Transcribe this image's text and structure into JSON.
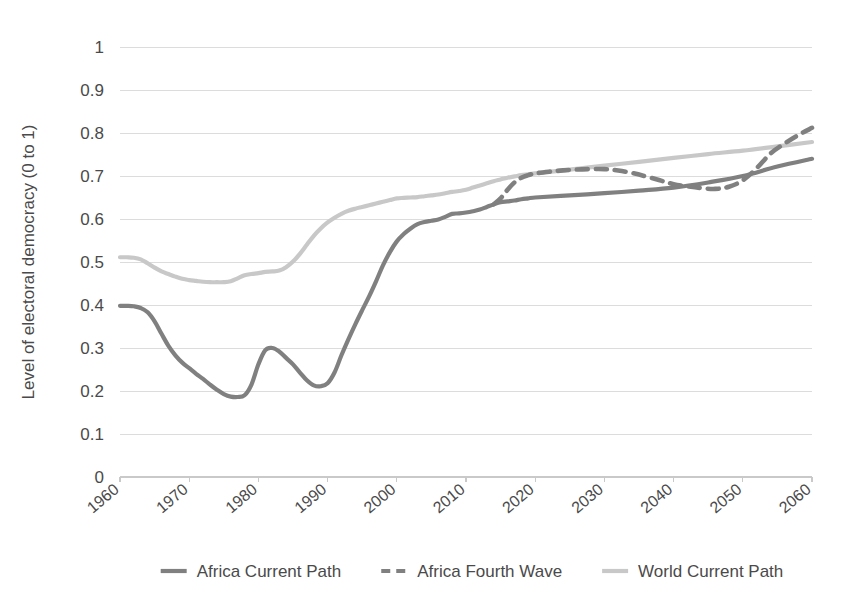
{
  "chart_data": {
    "type": "line",
    "title": "",
    "xlabel": "",
    "ylabel": "Level of electoral democracy (0 to 1)",
    "xlim": [
      1960,
      2060
    ],
    "ylim": [
      0,
      1
    ],
    "grid": true,
    "legend_position": "bottom",
    "ytick_labels": [
      "1",
      "0.9",
      "0.8",
      "0.7",
      "0.6",
      "0.5",
      "0.4",
      "0.3",
      "0.2",
      "0.1",
      "0"
    ],
    "ytick_values": [
      1,
      0.9,
      0.8,
      0.7,
      0.6,
      0.5,
      0.4,
      0.3,
      0.2,
      0.1,
      0
    ],
    "xtick_labels": [
      "1960",
      "1970",
      "1980",
      "1990",
      "2000",
      "2010",
      "2020",
      "2030",
      "2040",
      "2050",
      "2060"
    ],
    "xtick_values": [
      1960,
      1970,
      1980,
      1990,
      2000,
      2010,
      2020,
      2030,
      2040,
      2050,
      2060
    ],
    "colors": {
      "africa_current_path": "#808080",
      "africa_fourth_wave": "#808080",
      "world_current_path": "#c8c8c8",
      "gridline": "#dcdcdc",
      "axis": "#c9c9c9",
      "text": "#4a4a4a",
      "background": "#ffffff"
    },
    "series": [
      {
        "name": "Africa Current Path",
        "style": "solid",
        "color": "#808080",
        "x": [
          1960,
          1961,
          1962,
          1963,
          1964,
          1965,
          1966,
          1967,
          1968,
          1969,
          1970,
          1971,
          1972,
          1973,
          1974,
          1975,
          1976,
          1977,
          1978,
          1979,
          1980,
          1981,
          1982,
          1983,
          1984,
          1985,
          1986,
          1987,
          1988,
          1989,
          1990,
          1991,
          1992,
          1993,
          1994,
          1995,
          1996,
          1997,
          1998,
          1999,
          2000,
          2001,
          2002,
          2003,
          2004,
          2005,
          2006,
          2007,
          2008,
          2009,
          2010,
          2011,
          2012,
          2013,
          2014,
          2015,
          2016,
          2017,
          2018,
          2019,
          2020,
          2025,
          2030,
          2035,
          2040,
          2045,
          2050,
          2055,
          2060
        ],
        "values": [
          0.398,
          0.398,
          0.397,
          0.393,
          0.383,
          0.362,
          0.333,
          0.305,
          0.283,
          0.266,
          0.253,
          0.24,
          0.228,
          0.215,
          0.203,
          0.193,
          0.187,
          0.186,
          0.19,
          0.215,
          0.262,
          0.295,
          0.3,
          0.292,
          0.277,
          0.262,
          0.243,
          0.225,
          0.213,
          0.211,
          0.218,
          0.243,
          0.283,
          0.32,
          0.355,
          0.388,
          0.42,
          0.455,
          0.492,
          0.523,
          0.548,
          0.565,
          0.578,
          0.588,
          0.593,
          0.596,
          0.599,
          0.605,
          0.612,
          0.613,
          0.615,
          0.618,
          0.622,
          0.628,
          0.634,
          0.639,
          0.641,
          0.643,
          0.646,
          0.648,
          0.65,
          0.655,
          0.66,
          0.666,
          0.673,
          0.685,
          0.7,
          0.722,
          0.74
        ]
      },
      {
        "name": "Africa Fourth Wave",
        "style": "dashed",
        "color": "#808080",
        "x": [
          2014,
          2015,
          2016,
          2017,
          2018,
          2019,
          2020,
          2022,
          2024,
          2026,
          2028,
          2030,
          2032,
          2034,
          2036,
          2038,
          2040,
          2042,
          2044,
          2046,
          2048,
          2050,
          2052,
          2054,
          2056,
          2058,
          2060
        ],
        "values": [
          0.634,
          0.648,
          0.668,
          0.685,
          0.696,
          0.702,
          0.706,
          0.71,
          0.713,
          0.715,
          0.716,
          0.716,
          0.713,
          0.707,
          0.699,
          0.69,
          0.681,
          0.676,
          0.672,
          0.67,
          0.675,
          0.69,
          0.718,
          0.752,
          0.775,
          0.795,
          0.812
        ]
      },
      {
        "name": "World Current Path",
        "style": "solid",
        "color": "#c8c8c8",
        "x": [
          1960,
          1961,
          1962,
          1963,
          1964,
          1965,
          1966,
          1967,
          1968,
          1969,
          1970,
          1971,
          1972,
          1973,
          1974,
          1975,
          1976,
          1977,
          1978,
          1979,
          1980,
          1981,
          1982,
          1983,
          1984,
          1985,
          1986,
          1987,
          1988,
          1989,
          1990,
          1991,
          1992,
          1993,
          1994,
          1995,
          1996,
          1997,
          1998,
          1999,
          2000,
          2001,
          2002,
          2003,
          2004,
          2005,
          2006,
          2007,
          2008,
          2009,
          2010,
          2011,
          2012,
          2013,
          2014,
          2015,
          2016,
          2017,
          2018,
          2019,
          2020,
          2025,
          2030,
          2035,
          2040,
          2045,
          2050,
          2055,
          2060
        ],
        "values": [
          0.511,
          0.511,
          0.51,
          0.506,
          0.497,
          0.487,
          0.478,
          0.472,
          0.466,
          0.461,
          0.458,
          0.456,
          0.454,
          0.453,
          0.453,
          0.453,
          0.455,
          0.462,
          0.469,
          0.472,
          0.474,
          0.477,
          0.478,
          0.48,
          0.488,
          0.501,
          0.519,
          0.54,
          0.561,
          0.578,
          0.592,
          0.603,
          0.612,
          0.619,
          0.624,
          0.628,
          0.632,
          0.636,
          0.64,
          0.644,
          0.648,
          0.649,
          0.65,
          0.651,
          0.653,
          0.655,
          0.657,
          0.66,
          0.663,
          0.665,
          0.668,
          0.673,
          0.678,
          0.683,
          0.688,
          0.692,
          0.696,
          0.699,
          0.702,
          0.704,
          0.706,
          0.715,
          0.724,
          0.733,
          0.742,
          0.751,
          0.759,
          0.769,
          0.779
        ]
      }
    ]
  },
  "legend": {
    "items": [
      {
        "label": "Africa Current Path",
        "style": "solid",
        "color": "#808080"
      },
      {
        "label": "Africa Fourth Wave",
        "style": "dashed",
        "color": "#808080"
      },
      {
        "label": "World Current Path",
        "style": "solid",
        "color": "#c8c8c8"
      }
    ]
  }
}
